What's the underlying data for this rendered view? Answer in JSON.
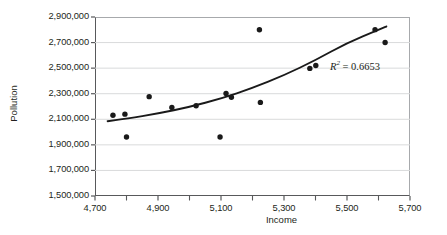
{
  "chart_data": {
    "type": "scatter",
    "title": "",
    "xlabel": "Income",
    "ylabel": "Pollution",
    "xlim": [
      4700,
      5700
    ],
    "ylim": [
      1500000,
      2900000
    ],
    "grid": "horizontal",
    "legend": false,
    "annotation": "R2 = 0.6653",
    "annotation_r2_prefix": "R",
    "annotation_r2_exponent": "2",
    "annotation_r2_value": "= 0.6653",
    "r_squared": 0.6653,
    "xticks": [
      4700,
      4900,
      5100,
      5300,
      5500,
      5700
    ],
    "xtick_labels": [
      "4,700",
      "4,900",
      "5,100",
      "5,300",
      "5,500",
      "5,700"
    ],
    "xminor_ticks": [
      4800,
      5000,
      5200,
      5400,
      5600
    ],
    "yticks": [
      1500000,
      1700000,
      1900000,
      2100000,
      2300000,
      2500000,
      2700000,
      2900000
    ],
    "ytick_labels": [
      "1,500,000",
      "1,700,000",
      "1,900,000",
      "2,100,000",
      "2,300,000",
      "2,500,000",
      "2,700,000",
      "2,900,000"
    ],
    "marker_color": "#1a1a1a",
    "trend_color": "#1a1a1a",
    "grid_color": "#d9dadb",
    "axis_color": "#58595b",
    "points": [
      {
        "x": 4757,
        "y": 2132000
      },
      {
        "x": 4795,
        "y": 2140000
      },
      {
        "x": 4800,
        "y": 1962000
      },
      {
        "x": 4872,
        "y": 2277000
      },
      {
        "x": 4944,
        "y": 2192000
      },
      {
        "x": 5021,
        "y": 2206000
      },
      {
        "x": 5097,
        "y": 1962000
      },
      {
        "x": 5116,
        "y": 2302000
      },
      {
        "x": 5133,
        "y": 2272000
      },
      {
        "x": 5222,
        "y": 2800000
      },
      {
        "x": 5225,
        "y": 2232000
      },
      {
        "x": 5382,
        "y": 2498000
      },
      {
        "x": 5401,
        "y": 2521000
      },
      {
        "x": 5589,
        "y": 2801000
      },
      {
        "x": 5621,
        "y": 2700000
      }
    ],
    "trend_curve": [
      {
        "x": 4740,
        "y": 2085000
      },
      {
        "x": 4800,
        "y": 2105000
      },
      {
        "x": 4900,
        "y": 2145000
      },
      {
        "x": 5000,
        "y": 2196000
      },
      {
        "x": 5100,
        "y": 2262000
      },
      {
        "x": 5200,
        "y": 2344000
      },
      {
        "x": 5300,
        "y": 2444000
      },
      {
        "x": 5400,
        "y": 2562000
      },
      {
        "x": 5500,
        "y": 2698000
      },
      {
        "x": 5600,
        "y": 2800000
      },
      {
        "x": 5625,
        "y": 2826000
      }
    ]
  }
}
